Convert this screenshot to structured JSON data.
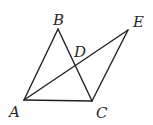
{
  "diagram": {
    "type": "geometry",
    "points": {
      "A": {
        "x": 24,
        "y": 100,
        "label": "A",
        "lx": 9,
        "ly": 117
      },
      "B": {
        "x": 58,
        "y": 29,
        "label": "B",
        "lx": 53,
        "ly": 25
      },
      "C": {
        "x": 92,
        "y": 101,
        "label": "C",
        "lx": 96,
        "ly": 118
      },
      "D": {
        "x": 76,
        "y": 66,
        "label": "D",
        "lx": 74,
        "ly": 57
      },
      "E": {
        "x": 128,
        "y": 30,
        "label": "E",
        "lx": 133,
        "ly": 27
      }
    },
    "segments": [
      [
        "A",
        "B"
      ],
      [
        "B",
        "C"
      ],
      [
        "A",
        "C"
      ],
      [
        "A",
        "E"
      ],
      [
        "C",
        "E"
      ]
    ],
    "colors": {
      "stroke": "#222222",
      "label": "#2a2a2a",
      "background": "#ffffff"
    }
  }
}
